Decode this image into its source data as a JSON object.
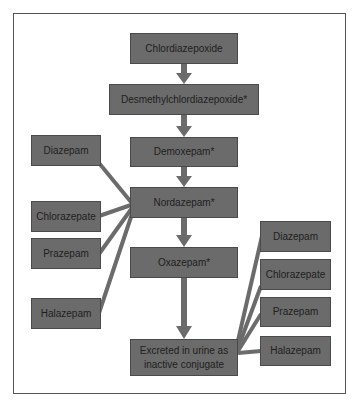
{
  "diagram": {
    "type": "metabolic pathway flowchart",
    "main_chain": [
      {
        "id": "chlordiazepoxide",
        "label": "Chlordiazepoxide"
      },
      {
        "id": "desmethyl",
        "label": "Desmethylchlordiazepoxide*"
      },
      {
        "id": "demoxepam",
        "label": "Demoxepam*"
      },
      {
        "id": "nordazepam",
        "label": "Nordazepam*"
      },
      {
        "id": "oxazepam",
        "label": "Oxazepam*"
      },
      {
        "id": "excreted",
        "label": "Excreted in urine as inactive conjugate"
      }
    ],
    "left_inputs": [
      {
        "label": "Diazepam",
        "target": "Nordazepam*"
      },
      {
        "label": "Chlorazepate",
        "target": "Nordazepam*"
      },
      {
        "label": "Prazepam",
        "target": "Nordazepam*"
      },
      {
        "label": "Halazepam",
        "target": "Nordazepam*"
      }
    ],
    "right_inputs": [
      {
        "label": "Diazepam",
        "target": "Excreted in urine as inactive conjugate"
      },
      {
        "label": "Chlorazepate",
        "target": "Excreted in urine as inactive conjugate"
      },
      {
        "label": "Prazepam",
        "target": "Excreted in urine as inactive conjugate"
      },
      {
        "label": "Halazepam",
        "target": "Excreted in urine as inactive conjugate"
      }
    ],
    "colors": {
      "box_fill": "#6b6b6b",
      "arrow": "#6b6b6b",
      "frame": "#555555",
      "text": "#1e1e1e"
    }
  }
}
